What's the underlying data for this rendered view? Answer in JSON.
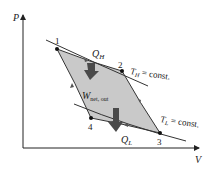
{
  "diagram": {
    "type": "P-v diagram, Carnot heat engine cycle",
    "axes": {
      "y_label": "P",
      "x_label": "V"
    },
    "points": [
      {
        "id": "1",
        "label": "1",
        "x": 57,
        "y": 49
      },
      {
        "id": "2",
        "label": "2",
        "x": 122,
        "y": 71
      },
      {
        "id": "3",
        "label": "3",
        "x": 160,
        "y": 133
      },
      {
        "id": "4",
        "label": "4",
        "x": 91,
        "y": 118
      }
    ],
    "isotherms": {
      "high": {
        "label_main": "T",
        "label_sub": "H",
        "label_rest": " = const."
      },
      "low": {
        "label_main": "T",
        "label_sub": "L",
        "label_rest": " = const."
      }
    },
    "heat_in": {
      "label_main": "Q",
      "label_sub": "H"
    },
    "heat_out": {
      "label_main": "Q",
      "label_sub": "L"
    },
    "work": {
      "label_main": "W",
      "label_sub": "net, out"
    },
    "colors": {
      "fill": "#c9c9c9",
      "arrow": "#4a4a4a",
      "line": "#333333"
    }
  }
}
